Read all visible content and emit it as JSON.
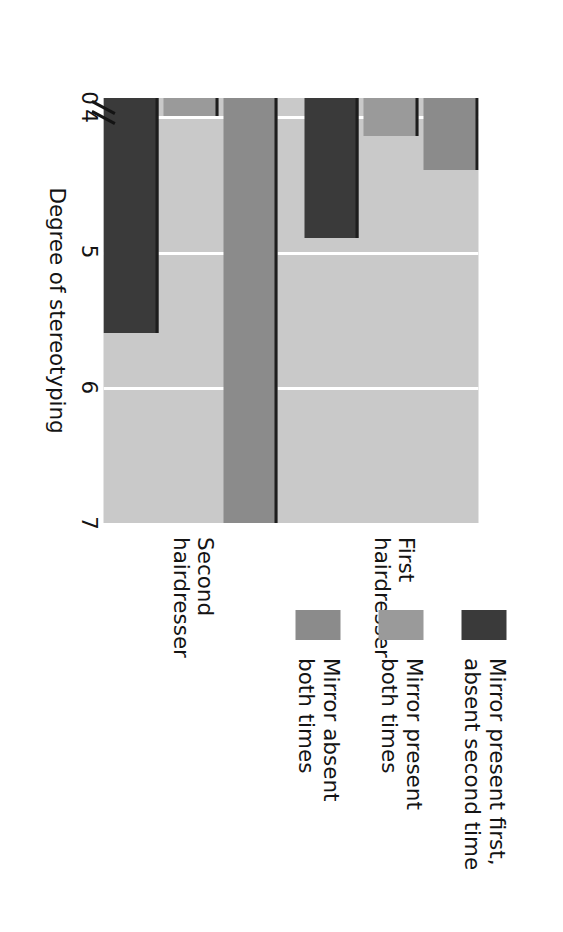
{
  "chart_data": {
    "type": "bar",
    "title": "",
    "orientation": "vertical",
    "rendered_rotation_degrees": 90,
    "xlabel": "",
    "ylabel": "Degree of stereotyping",
    "categories": [
      "First\nhairdresser",
      "Second\nhairdresser"
    ],
    "category_labels_flat": [
      "First hairdresser",
      "Second hairdresser"
    ],
    "ylim": [
      0,
      7.4
    ],
    "yticks": [
      0,
      4,
      5,
      6,
      7
    ],
    "ytick_labels": [
      "0",
      "4",
      "5",
      "6",
      "7"
    ],
    "axis_break": true,
    "axis_break_between": [
      0,
      4
    ],
    "grid": "horizontal-white",
    "legend_position": "right",
    "series": [
      {
        "name": "Mirror absent\nboth times",
        "name_flat": "Mirror absent both times",
        "color": "#8b8b8b",
        "values": [
          4.4,
          7.0
        ]
      },
      {
        "name": "Mirror present\nboth times",
        "name_flat": "Mirror present both times",
        "color": "#9a9a9a",
        "values": [
          4.15,
          4.0
        ]
      },
      {
        "name": "Mirror present first,\nabsent second time",
        "name_flat": "Mirror present first, absent second time",
        "color": "#3a3a3a",
        "values": [
          4.9,
          5.6
        ]
      }
    ]
  },
  "axis": {
    "y_title": "Degree of stereotyping",
    "ticks": [
      {
        "label": "7",
        "value": 7
      },
      {
        "label": "6",
        "value": 6
      },
      {
        "label": "5",
        "value": 5
      },
      {
        "label": "4",
        "value": 4
      },
      {
        "label": "0",
        "value": 0
      }
    ]
  },
  "groups": [
    {
      "label": "First\nhairdresser"
    },
    {
      "label": "Second\nhairdresser"
    }
  ],
  "legend": {
    "items": [
      {
        "label": "Mirror present first,\nabsent second time",
        "color": "#3a3a3a"
      },
      {
        "label": "Mirror present\nboth times",
        "color": "#9a9a9a"
      },
      {
        "label": "Mirror absent\nboth times",
        "color": "#8b8b8b"
      }
    ]
  },
  "colors": {
    "plot_background": "#c9c9c9",
    "gridline": "#ffffff",
    "bar_outline": "#1d1d1d",
    "text": "#141414",
    "dark": "#3a3a3a",
    "medium": "#9a9a9a",
    "light": "#8b8b8b"
  }
}
